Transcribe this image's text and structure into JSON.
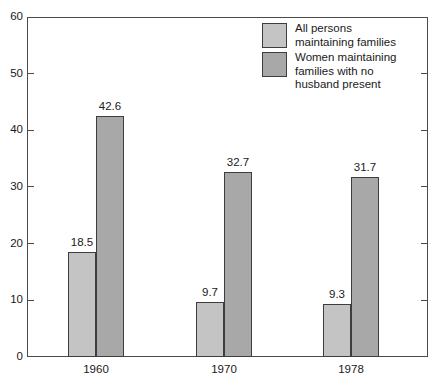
{
  "chart_data": {
    "type": "bar",
    "title": "",
    "subtitle": "",
    "xlabel": "",
    "ylabel": "",
    "categories": [
      "1960",
      "1970",
      "1978"
    ],
    "series": [
      {
        "name": "All persons maintaining families",
        "legend_label": "All persons\nmaintaining families",
        "color": "#c4c4c4",
        "values": [
          18.5,
          9.7,
          9.3
        ],
        "value_labels": [
          "18.5",
          "9.7",
          "9.3"
        ]
      },
      {
        "name": "Women maintaining families with no husband present",
        "legend_label": "Women maintaining\nfamilies with no\nhusband present",
        "color": "#a8a8a8",
        "values": [
          42.6,
          32.7,
          31.7
        ],
        "value_labels": [
          "42.6",
          "32.7",
          "31.7"
        ]
      }
    ],
    "ylim": [
      0,
      60
    ],
    "yticks": [
      0,
      10,
      20,
      30,
      40,
      50,
      60
    ],
    "ytick_labels": [
      "0",
      "10",
      "20",
      "30",
      "40",
      "50",
      "60"
    ],
    "grid": false,
    "legend_position": "top-right",
    "axis_color": "#4a4a4a",
    "bar_border_color": "#3d3d3d",
    "text_color": "#1a1a1a",
    "background": "#ffffff"
  },
  "layout": {
    "plot": {
      "left": 27,
      "top": 17,
      "width": 401,
      "height": 340
    },
    "bar_width": 28,
    "group_starts": [
      68,
      196,
      323
    ]
  }
}
